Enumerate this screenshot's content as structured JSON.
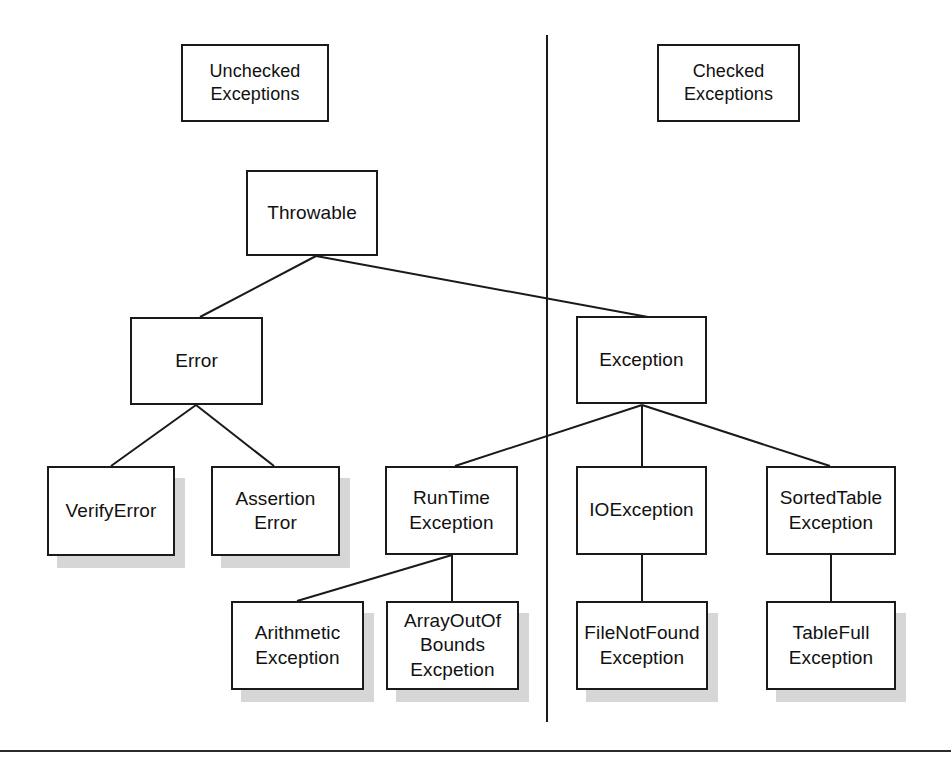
{
  "diagram": {
    "background_color": "#ffffff",
    "line_color": "#1a1a1a",
    "shadow_color": "#d6d6d6",
    "text_color": "#111111",
    "headers": [
      {
        "id": "unchecked-header",
        "label": "Unchecked\nExceptions",
        "x": 181,
        "y": 44,
        "w": 148,
        "h": 78
      },
      {
        "id": "checked-header",
        "label": "Checked\nExceptions",
        "x": 657,
        "y": 44,
        "w": 143,
        "h": 78
      }
    ],
    "divider": {
      "x": 546,
      "y1": 35,
      "y2": 722
    },
    "bottom_rule": {
      "x1": 0,
      "x2": 951,
      "y": 750
    },
    "nodes": [
      {
        "id": "throwable",
        "label": "Throwable",
        "x": 246,
        "y": 170,
        "w": 132,
        "h": 86,
        "shadow": false
      },
      {
        "id": "error",
        "label": "Error",
        "x": 130,
        "y": 317,
        "w": 133,
        "h": 88,
        "shadow": false
      },
      {
        "id": "exception",
        "label": "Exception",
        "x": 576,
        "y": 316,
        "w": 131,
        "h": 88,
        "shadow": false
      },
      {
        "id": "verify-error",
        "label": "VerifyError",
        "x": 47,
        "y": 466,
        "w": 128,
        "h": 90,
        "shadow": true
      },
      {
        "id": "assertion-error",
        "label": "Assertion\nError",
        "x": 211,
        "y": 466,
        "w": 129,
        "h": 90,
        "shadow": true
      },
      {
        "id": "runtime-exception",
        "label": "RunTime\nException",
        "x": 385,
        "y": 466,
        "w": 133,
        "h": 89,
        "shadow": false
      },
      {
        "id": "io-exception",
        "label": "IOException",
        "x": 576,
        "y": 466,
        "w": 131,
        "h": 89,
        "shadow": false
      },
      {
        "id": "sortedtable-exception",
        "label": "SortedTable\nException",
        "x": 766,
        "y": 466,
        "w": 130,
        "h": 89,
        "shadow": false
      },
      {
        "id": "arithmetic-exception",
        "label": "Arithmetic\nException",
        "x": 231,
        "y": 601,
        "w": 133,
        "h": 89,
        "shadow": true
      },
      {
        "id": "arrayoutofbounds-exception",
        "label": "ArrayOutOf\nBounds\nExcpetion",
        "x": 386,
        "y": 601,
        "w": 133,
        "h": 89,
        "shadow": true
      },
      {
        "id": "filenotfound-exception",
        "label": "FileNotFound\nException",
        "x": 576,
        "y": 601,
        "w": 132,
        "h": 89,
        "shadow": true
      },
      {
        "id": "tablefull-exception",
        "label": "TableFull\nException",
        "x": 766,
        "y": 601,
        "w": 130,
        "h": 89,
        "shadow": true
      }
    ],
    "edges": [
      {
        "id": "throwable-to-error",
        "from": "throwable",
        "to": "error",
        "points": "316,256 200,317"
      },
      {
        "id": "throwable-to-exception",
        "from": "throwable",
        "to": "exception",
        "points": "316,256 648,317"
      },
      {
        "id": "error-to-verify-error",
        "from": "error",
        "to": "verify-error",
        "points": "196,405 111,466"
      },
      {
        "id": "error-to-assertion-error",
        "from": "error",
        "to": "assertion-error",
        "points": "196,405 274,466"
      },
      {
        "id": "exception-to-runtime",
        "from": "exception",
        "to": "runtime-exception",
        "points": "642,405 455,466"
      },
      {
        "id": "exception-to-ioexception",
        "from": "exception",
        "to": "io-exception",
        "points": "642,405 642,466"
      },
      {
        "id": "exception-to-sortedtable",
        "from": "exception",
        "to": "sortedtable-exception",
        "points": "642,405 830,466"
      },
      {
        "id": "runtime-to-arithmetic",
        "from": "runtime-exception",
        "to": "arithmetic-exception",
        "points": "452,555 297,601"
      },
      {
        "id": "runtime-to-arrayoutofbounds",
        "from": "runtime-exception",
        "to": "arrayoutofbounds-exception",
        "points": "452,555 452,601"
      },
      {
        "id": "ioexception-to-filenotfound",
        "from": "io-exception",
        "to": "filenotfound-exception",
        "points": "642,555 642,601"
      },
      {
        "id": "sortedtable-to-tablefull",
        "from": "sortedtable-exception",
        "to": "tablefull-exception",
        "points": "831,555 831,601"
      }
    ]
  }
}
